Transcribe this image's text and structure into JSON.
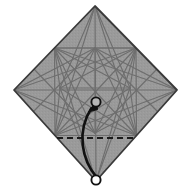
{
  "figure": {
    "caption": "",
    "type": "origami-step-diagram",
    "step_number": "",
    "canvas": {
      "width": 184,
      "height": 196
    }
  },
  "colors": {
    "paper_fill": "#9a9a9a",
    "paper_edge": "#3a3a3a",
    "crease_line": "#6e6e6e",
    "fold_line_dashed": "#1a1a1a",
    "arrow": "#111111",
    "marker_stroke": "#111111",
    "marker_fill": "#ffffff",
    "background": "#ffffff"
  },
  "shape": {
    "name": "square-rotated-diamond",
    "vertices": {
      "top": [
        95,
        6
      ],
      "right": [
        177,
        90
      ],
      "bottom": [
        96,
        181
      ],
      "left": [
        14,
        90
      ]
    }
  },
  "creases": {
    "description": "pre-creased square with diagonals, midlines and 22.5-degree star creases",
    "hubs": {
      "center": [
        95,
        93
      ],
      "upper": [
        95,
        48
      ],
      "left": [
        60,
        88
      ],
      "right": [
        130,
        88
      ],
      "lower": [
        95,
        133
      ]
    }
  },
  "fold_line": {
    "name": "valley-fold-dashed",
    "style": "dashed",
    "from": [
      57,
      138
    ],
    "to": [
      136,
      138
    ],
    "dash_pattern": "6 4"
  },
  "arrow": {
    "name": "fold-arrow",
    "style": "curved-solid-arrow",
    "from_label": "bottom point",
    "to_label": "center point",
    "start": [
      96,
      178
    ],
    "end": [
      96,
      104
    ],
    "control": [
      76,
      142
    ]
  },
  "markers": [
    {
      "name": "reference-point-center",
      "cx": 96,
      "cy": 102,
      "r": 4.6
    },
    {
      "name": "reference-point-bottom",
      "cx": 96,
      "cy": 180,
      "r": 4.6
    }
  ],
  "labels": {
    "alt_text": "Grey square origami paper rotated as a diamond, covered in faint crease lines, with a dashed horizontal valley-fold line near the lower area and a curved arrow showing the bottom corner folding up to the marked centre point."
  }
}
